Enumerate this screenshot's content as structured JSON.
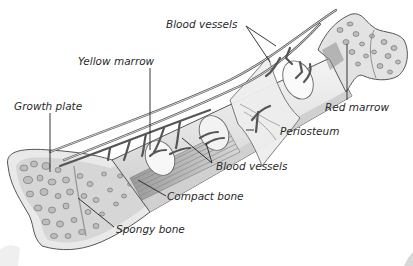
{
  "diagram": {
    "labels": {
      "blood_vessels_top": "Blood vessels",
      "yellow_marrow": "Yellow marrow",
      "growth_plate": "Growth plate",
      "red_marrow": "Red marrow",
      "periosteum": "Periosteum",
      "blood_vessels_middle": "Blood vessels",
      "compact_bone": "Compact bone",
      "spongy_bone": "Spongy bone"
    },
    "colors": {
      "background": "#ffffff",
      "bone_fill": "#e6e6e6",
      "spongy_fill": "#d0d0d0",
      "line": "#222222"
    }
  }
}
